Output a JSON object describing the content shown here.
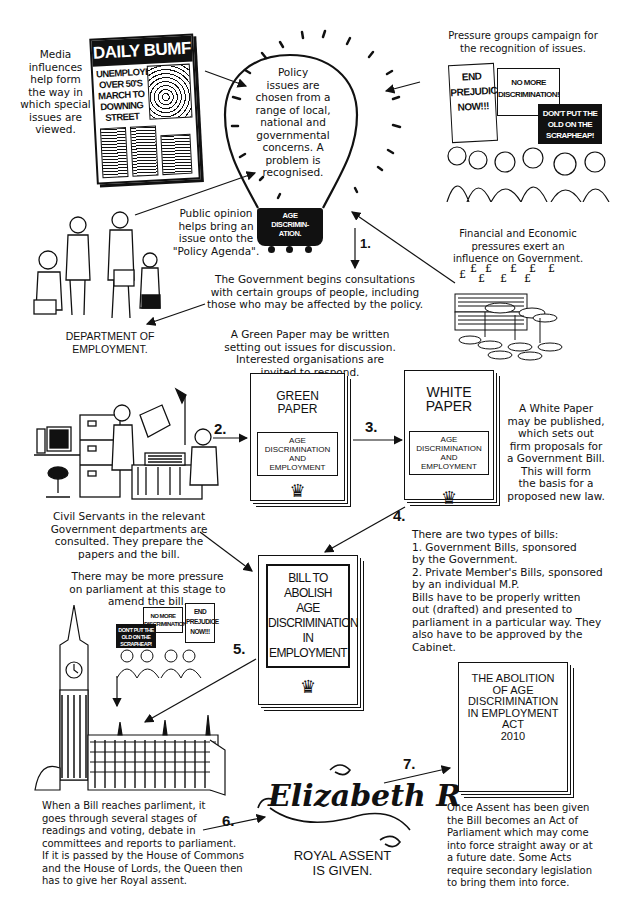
{
  "diagram": {
    "type": "process-flow",
    "topic": "How a bill becomes law (Age Discrimination)"
  },
  "media": {
    "caption": "Media\ninfluences\nhelp form\nthe way in\nwhich special\nissues are\nviewed.",
    "newspaper": {
      "masthead": "DAILY BUMF",
      "headline": "UNEMPLOYED\nOVER 50'S\nMARCH TO\nDOWNING\nSTREET"
    }
  },
  "bulb": {
    "text": "Policy\nissues are\nchosen from a\nrange of local,\nnational and\ngovernmental\nconcerns. A\nproblem is\nrecognised.",
    "label": "AGE\nDISCRIMIN-\nATION."
  },
  "pressure_groups": {
    "caption": "Pressure groups campaign for\nthe recognition of issues.",
    "signs": [
      "END\nPREJUDICE\nNOW!!!",
      "NO MORE\nDISCRIMINATION!",
      "DON'T PUT THE\nOLD ON THE\nSCRAPHEAP!"
    ]
  },
  "public_opinion": {
    "caption": "Public opinion\nhelps bring an\nissue onto the\n\"Policy Agenda\"."
  },
  "financial": {
    "caption": "Financial and Economic\npressures exert an\ninfluence on Government.",
    "symbol": "£"
  },
  "steps": {
    "s1": "1.",
    "s2": "2.",
    "s3": "3.",
    "s4": "4.",
    "s5": "5.",
    "s6": "6.",
    "s7": "7."
  },
  "consultation": {
    "caption": "The Government begins consultations\nwith certain groups of people, including\nthose who may be affected by the policy.",
    "department": "DEPARTMENT OF\nEMPLOYMENT."
  },
  "green_paper": {
    "caption": "A Green Paper may be written\nsetting out issues for discussion.\nInterested organisations are\ninvited to respond.",
    "title": "GREEN\nPAPER",
    "subject": "AGE\nDISCRIMINATION\nAND\nEMPLOYMENT"
  },
  "white_paper": {
    "title": "WHITE\nPAPER",
    "subject": "AGE\nDISCRIMINATION\nAND\nEMPLOYMENT",
    "caption": "A White Paper\nmay be published,\nwhich sets out\nfirm proposals for\na Government Bill.\nThis will form\nthe basis for a\nproposed new law."
  },
  "civil_servants": {
    "caption": "Civil Servants in the relevant\nGovernment departments are\nconsulted. They prepare the\npapers and the bill."
  },
  "bills": {
    "caption": "There are two types of bills:\n1. Government Bills, sponsored\nby the Government.\n2. Private Member's Bills, sponsored\nby an individual M.P.\nBills have to be properly written\nout (drafted) and presented to\nparliament in a particular way. They\nalso have to be approved by the\nCabinet.",
    "bill_title": "BILL TO\nABOLISH\nAGE\nDISCRIMINATION\nIN\nEMPLOYMENT"
  },
  "parliament": {
    "pressure_caption": "There may be more pressure\non parliament at this stage to\namend the bill.",
    "signs": [
      "NO MORE\nDISCRIMINATION!",
      "END\nPREJUDICE\nNOW!!!",
      "DON'T PUT THE\nOLD ON THE\nSCRAPHEAP!"
    ],
    "caption": "When a Bill reaches parliment, it\ngoes through several stages of\nreadings and voting, debate in\ncommittees and reports to parliament.\nIf it is passed by the House of Commons\nand the House of Lords, the Queen then\nhas to give her Royal assent."
  },
  "royal_assent": {
    "signature": "Elizabeth R",
    "caption": "ROYAL ASSENT\nIS GIVEN."
  },
  "act": {
    "title": "THE ABOLITION\nOF AGE\nDISCRIMINATION\nIN EMPLOYMENT\nACT\n2010",
    "caption": "Once Assent has been given\nthe Bill becomes an Act of\nParliament which may come\ninto force straight away or at\na future date. Some Acts\nrequire secondary legislation\nto bring them into force."
  }
}
